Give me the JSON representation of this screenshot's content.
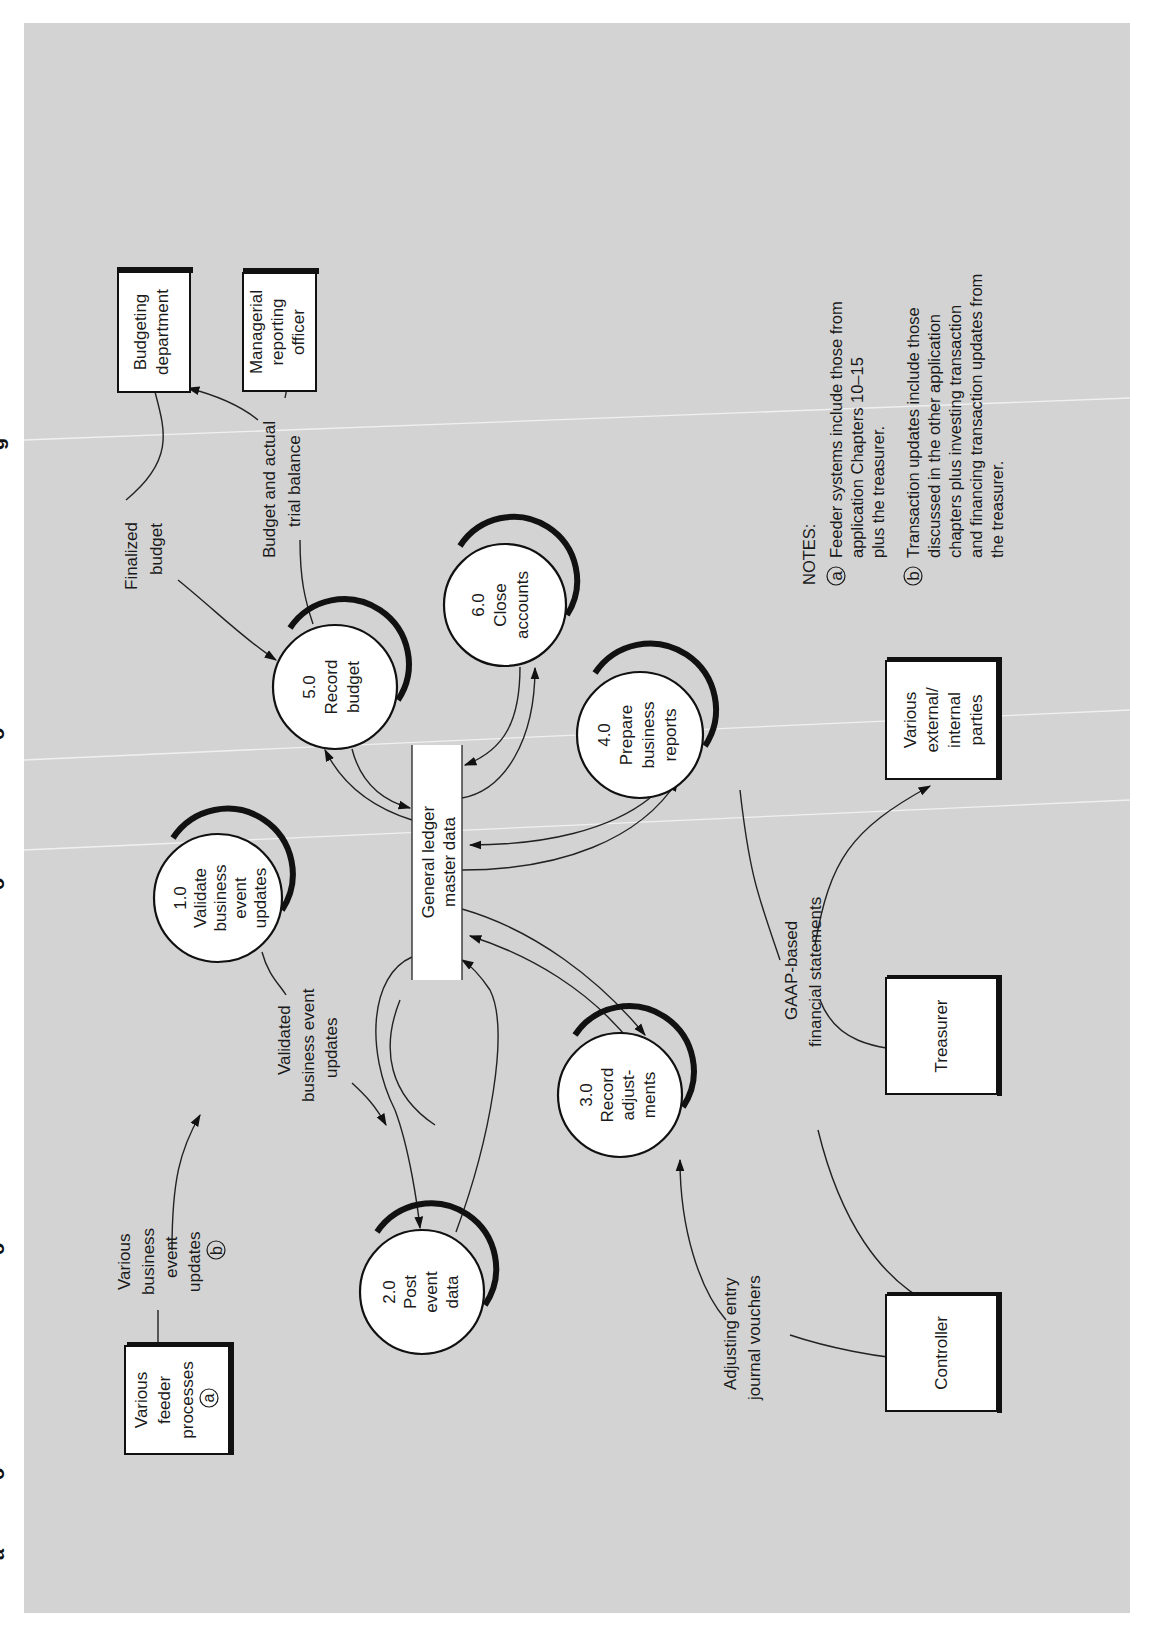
{
  "figure": {
    "orientation": "rotated-90-ccw",
    "edge_caption_fragments": [
      "g",
      "o",
      "o",
      "o",
      "o",
      "a"
    ],
    "colors": {
      "paper": "#d3d3d3",
      "node_fill": "#ffffff",
      "ink": "#111111",
      "crease": "#f4f4f4"
    }
  },
  "external_entities": [
    {
      "id": "budgeting",
      "lines": [
        "Budgeting",
        "department"
      ]
    },
    {
      "id": "managerial",
      "lines": [
        "Managerial",
        "reporting",
        "officer"
      ]
    },
    {
      "id": "feeder",
      "lines": [
        "Various",
        "feeder",
        "processes"
      ],
      "badge": "a"
    },
    {
      "id": "parties",
      "lines": [
        "Various",
        "external/",
        "internal",
        "parties"
      ]
    },
    {
      "id": "treasurer",
      "lines": [
        "Treasurer"
      ]
    },
    {
      "id": "controller",
      "lines": [
        "Controller"
      ]
    }
  ],
  "processes": [
    {
      "id": "p1",
      "number": "1.0",
      "lines": [
        "Validate",
        "business",
        "event",
        "updates"
      ]
    },
    {
      "id": "p2",
      "number": "2.0",
      "lines": [
        "Post",
        "event",
        "data"
      ]
    },
    {
      "id": "p3",
      "number": "3.0",
      "lines": [
        "Record",
        "adjust-",
        "ments"
      ]
    },
    {
      "id": "p4",
      "number": "4.0",
      "lines": [
        "Prepare",
        "business",
        "reports"
      ]
    },
    {
      "id": "p5",
      "number": "5.0",
      "lines": [
        "Record",
        "budget"
      ]
    },
    {
      "id": "p6",
      "number": "6.0",
      "lines": [
        "Close",
        "accounts"
      ]
    }
  ],
  "data_store": {
    "lines": [
      "General ledger",
      "master data"
    ]
  },
  "flows": [
    {
      "id": "finalized_budget",
      "lines": [
        "Finalized",
        "budget"
      ]
    },
    {
      "id": "budget_actual",
      "lines": [
        "Budget and actual",
        "trial balance"
      ]
    },
    {
      "id": "various_updates",
      "lines": [
        "Various",
        "business",
        "event",
        "updates"
      ],
      "badge": "b"
    },
    {
      "id": "validated_updates",
      "lines": [
        "Validated",
        "business event",
        "updates"
      ]
    },
    {
      "id": "adjusting_entry",
      "lines": [
        "Adjusting entry",
        "journal vouchers"
      ]
    },
    {
      "id": "gaap",
      "lines": [
        "GAAP-based",
        "financial statements"
      ]
    }
  ],
  "notes": {
    "title": "NOTES:",
    "items": [
      {
        "badge": "a",
        "lines": [
          "Feeder systems include those from",
          "application Chapters 10–15",
          "plus the treasurer."
        ]
      },
      {
        "badge": "b",
        "lines": [
          "Transaction updates include those",
          "discussed in the other application",
          "chapters plus investing transaction",
          "and financing transaction updates from",
          "the treasurer."
        ]
      }
    ]
  }
}
